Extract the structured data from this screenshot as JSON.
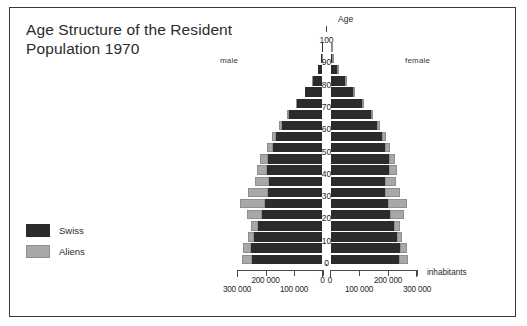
{
  "title": "Age Structure of the Resident\nPopulation   1970",
  "labels": {
    "male": "male",
    "female": "female",
    "age_axis": "Age",
    "unit": "inhabitants"
  },
  "legend": {
    "swiss": "Swiss",
    "aliens": "Aliens"
  },
  "colors": {
    "swiss": "#2b2b2b",
    "aliens": "#a8a8a8",
    "frame": "#3a3a3a",
    "text": "#2b2b2b",
    "background": "#ffffff"
  },
  "chart_data": {
    "type": "bar",
    "subtype": "population-pyramid",
    "title": "Age Structure of the Resident Population   1970",
    "xlabel": "inhabitants",
    "ylabel": "Age",
    "grid": false,
    "legend_position": "left-bottom",
    "x_ticks_left": [
      "300 000",
      "200 000",
      "100 000",
      "0"
    ],
    "x_ticks_right": [
      "0",
      "100 000",
      "200 000",
      "300 000"
    ],
    "xlim": [
      0,
      300000
    ],
    "ylim": [
      0,
      100
    ],
    "y_ticks": [
      0,
      10,
      20,
      30,
      40,
      50,
      60,
      70,
      80,
      90,
      100
    ],
    "age_groups": [
      "0-4",
      "5-9",
      "10-14",
      "15-19",
      "20-24",
      "25-29",
      "30-34",
      "35-39",
      "40-44",
      "45-49",
      "50-54",
      "55-59",
      "60-64",
      "65-69",
      "70-74",
      "75-79",
      "80-84",
      "85-89",
      "90-94",
      "95-99"
    ],
    "series": [
      {
        "name": "Swiss",
        "side": "male",
        "values": [
          247000,
          252000,
          240000,
          228000,
          212000,
          203000,
          192000,
          186000,
          193000,
          190000,
          175000,
          162000,
          142000,
          117000,
          88000,
          60000,
          34000,
          15000,
          5000,
          1200
        ]
      },
      {
        "name": "Aliens",
        "side": "male",
        "values": [
          34000,
          27000,
          21000,
          24000,
          52000,
          86000,
          70000,
          52000,
          38000,
          28000,
          20000,
          14000,
          10000,
          7000,
          4500,
          2500,
          1200,
          500,
          150,
          40
        ]
      },
      {
        "name": "Swiss",
        "side": "female",
        "values": [
          237000,
          241000,
          230000,
          220000,
          207000,
          200000,
          191000,
          190000,
          202000,
          202000,
          190000,
          179000,
          162000,
          140000,
          110000,
          80000,
          50000,
          24000,
          8000,
          2000
        ]
      },
      {
        "name": "Aliens",
        "side": "female",
        "values": [
          32000,
          25000,
          19000,
          23000,
          47000,
          67000,
          52000,
          38000,
          28000,
          22000,
          17000,
          13000,
          9000,
          6500,
          4200,
          2400,
          1200,
          500,
          150,
          40
        ]
      }
    ]
  }
}
